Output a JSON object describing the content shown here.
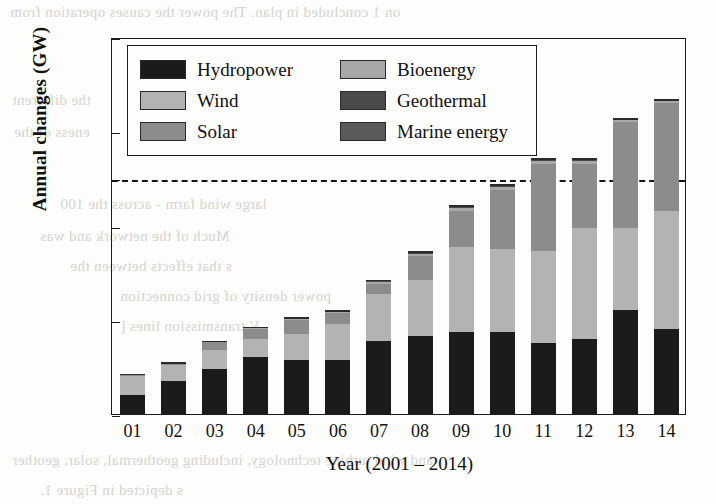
{
  "chart_data": {
    "type": "bar",
    "stacked": true,
    "title": "",
    "xlabel": "Year (2001 – 2014)",
    "ylabel": "Annual changes (GW)",
    "categories": [
      "01",
      "02",
      "03",
      "04",
      "05",
      "06",
      "07",
      "08",
      "09",
      "10",
      "11",
      "12",
      "13",
      "14"
    ],
    "xtick_labels": [
      "01",
      "02",
      "03",
      "04",
      "05",
      "06",
      "07",
      "08",
      "09",
      "10",
      "11",
      "12",
      "13",
      "14"
    ],
    "ytick_labels": [
      "0",
      "40",
      "80",
      "100",
      "120",
      "160"
    ],
    "ytick_values": [
      0,
      40,
      80,
      100,
      120,
      160
    ],
    "ylim": [
      0,
      160
    ],
    "grid": false,
    "legend_position": "upper left (inside, 2 columns)",
    "reference_line": {
      "value": 100,
      "style": "dashed",
      "color": "#151515"
    },
    "series": [
      {
        "name": "Hydropower",
        "color": "#1b1b1b",
        "values": [
          8,
          14,
          19,
          24,
          23,
          23,
          31,
          33,
          35,
          35,
          30,
          32,
          44,
          36
        ]
      },
      {
        "name": "Wind",
        "color": "#b3b3b3",
        "values": [
          8,
          7,
          8,
          8,
          11,
          15,
          20,
          24,
          36,
          35,
          39,
          47,
          35,
          50
        ]
      },
      {
        "name": "Solar",
        "color": "#8c8c8c",
        "values": [
          1,
          1,
          4,
          4,
          6,
          5,
          4,
          10,
          15,
          25,
          37,
          27,
          45,
          46
        ]
      },
      {
        "name": "Bioenergy",
        "color": "#a8a8a8",
        "values": [
          0,
          0,
          0,
          0.5,
          0.5,
          0.5,
          1,
          1,
          1.5,
          1.5,
          1.5,
          1.5,
          0.8,
          0.8
        ]
      },
      {
        "name": "Geothermal",
        "color": "#4a4a4a",
        "values": [
          0,
          0,
          0,
          0.3,
          0.3,
          0.3,
          0.6,
          0.6,
          0.6,
          0.6,
          0.6,
          0.6,
          0.4,
          0.4
        ]
      },
      {
        "name": "Marine energy",
        "color": "#5a5a5a",
        "values": [
          0,
          0,
          0,
          0.2,
          0.2,
          0.2,
          0.4,
          0.4,
          0.4,
          0.4,
          0.4,
          0.4,
          0.3,
          0.3
        ]
      }
    ],
    "totals": [
      17,
      22,
      31,
      37,
      41,
      44,
      57,
      69,
      88,
      97,
      108,
      108.5,
      125,
      133
    ]
  },
  "legend": {
    "items": [
      {
        "label": "Hydropower",
        "color": "#1b1b1b"
      },
      {
        "label": "Bioenergy",
        "color": "#a8a8a8"
      },
      {
        "label": "Wind",
        "color": "#b3b3b3"
      },
      {
        "label": "Geothermal",
        "color": "#4a4a4a"
      },
      {
        "label": "Solar",
        "color": "#8c8c8c"
      },
      {
        "label": "Marine energy",
        "color": "#5a5a5a"
      }
    ]
  },
  "page_bleed": {
    "lines": [
      "on 1 concluded in plan. The power the causes operation from",
      "the different",
      "eness of the",
      "large wind farm - across the 100",
      "Much of the network and was",
      "s that effects between the",
      "power density of grid connection",
      "V transmission lines [",
      "and wind turbine technology, including geothermal, solar, geother",
      "s depicted in Figure 1."
    ]
  }
}
